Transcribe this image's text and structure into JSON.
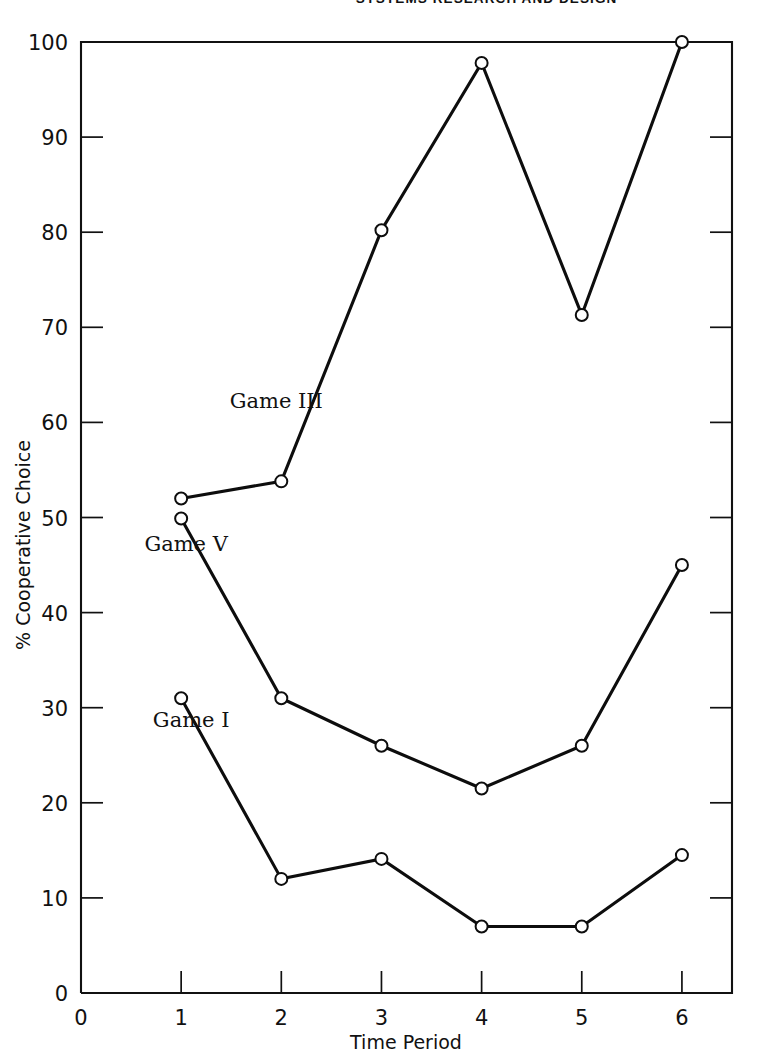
{
  "page": {
    "running_head": "SYSTEMS RESEARCH AND DESIGN",
    "folio": ""
  },
  "chart_data": {
    "type": "line",
    "title": "",
    "xlabel": "Time Period",
    "ylabel": "% Cooperative Choice",
    "x": [
      1,
      2,
      3,
      4,
      5,
      6
    ],
    "xlim": [
      0,
      6.5
    ],
    "ylim": [
      0,
      100
    ],
    "xticks": [
      0,
      1,
      2,
      3,
      4,
      5,
      6
    ],
    "xtick_labels": [
      "0",
      "1",
      "2",
      "3",
      "4",
      "5",
      "6"
    ],
    "yticks": [
      0,
      10,
      20,
      30,
      40,
      50,
      60,
      70,
      80,
      90,
      100
    ],
    "ytick_labels": [
      "0",
      "10",
      "20",
      "30",
      "40",
      "50",
      "60",
      "70",
      "80",
      "90",
      "100"
    ],
    "grid": false,
    "legend": "inline-labels",
    "marker": "open-circle",
    "line_color": "#0d0d0d",
    "marker_face_color": "#ffffff",
    "series": [
      {
        "name": "Game III",
        "label": "Game III",
        "values": [
          52,
          53.8,
          80.2,
          97.8,
          71.3,
          100
        ]
      },
      {
        "name": "Game V",
        "label": "Game V",
        "values": [
          49.9,
          31,
          26,
          21.5,
          26,
          45
        ]
      },
      {
        "name": "Game I",
        "label": "Game I",
        "values": [
          31,
          12,
          14.1,
          7,
          7,
          14.5
        ]
      }
    ],
    "annotations": [
      {
        "text": "Game III",
        "x": 1.95,
        "y": 61.5
      },
      {
        "text": "Game V",
        "x": 1.05,
        "y": 46.5
      },
      {
        "text": "Game I",
        "x": 1.1,
        "y": 28.0
      }
    ]
  }
}
